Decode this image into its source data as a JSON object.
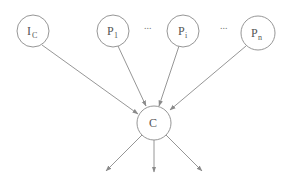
{
  "diagram": {
    "type": "directed-graph",
    "colors": {
      "stroke": "#8a8a8a",
      "text": "#555555",
      "background": "#ffffff"
    },
    "nodes": [
      {
        "id": "I_C",
        "label": "I",
        "subscript": "C",
        "cx": 33,
        "cy": 31,
        "r": 16
      },
      {
        "id": "P_1",
        "label": "P",
        "subscript": "1",
        "cx": 113,
        "cy": 31,
        "r": 16
      },
      {
        "id": "P_i",
        "label": "P",
        "subscript": "i",
        "cx": 183,
        "cy": 31,
        "r": 16
      },
      {
        "id": "P_n",
        "label": "P",
        "subscript": "n",
        "cx": 258,
        "cy": 33,
        "r": 17
      },
      {
        "id": "C",
        "label": "C",
        "subscript": "",
        "cx": 154,
        "cy": 123,
        "r": 17
      }
    ],
    "ellipses": [
      {
        "text": "...",
        "between": [
          "P_1",
          "P_i"
        ]
      },
      {
        "text": "...",
        "between": [
          "P_i",
          "P_n"
        ]
      }
    ],
    "edges": [
      {
        "from": "I_C",
        "to": "C"
      },
      {
        "from": "P_1",
        "to": "C"
      },
      {
        "from": "P_i",
        "to": "C"
      },
      {
        "from": "P_n",
        "to": "C"
      }
    ],
    "outgoing_edges": [
      {
        "from": "C",
        "direction": "down-left"
      },
      {
        "from": "C",
        "direction": "down"
      },
      {
        "from": "C",
        "direction": "down-right"
      }
    ]
  }
}
